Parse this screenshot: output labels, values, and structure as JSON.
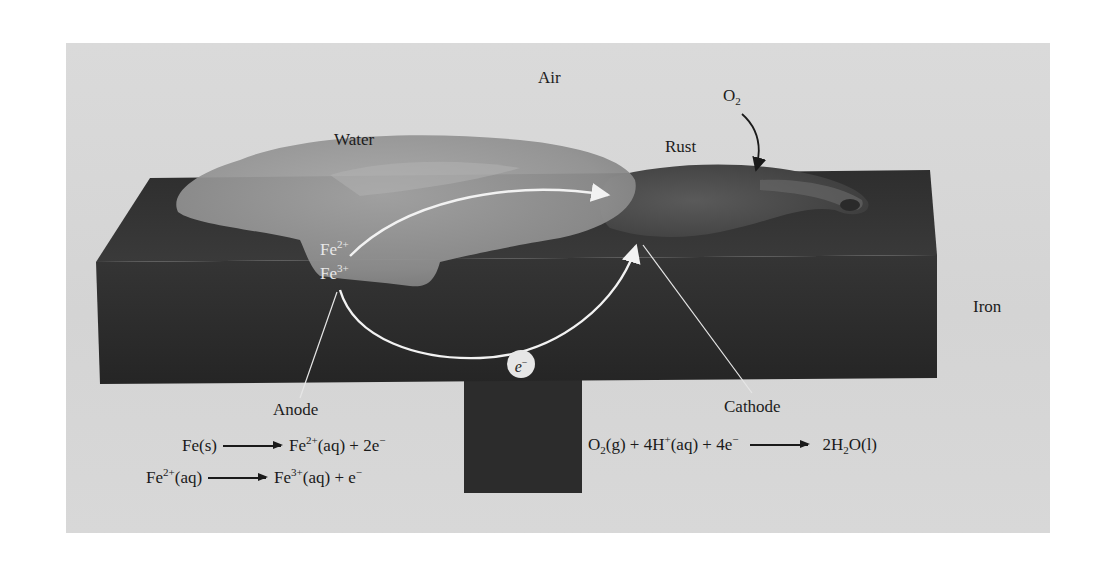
{
  "diagram": {
    "labels": {
      "air": "Air",
      "water": "Water",
      "rust": "Rust",
      "oxygen": {
        "base": "O",
        "sub": "2"
      },
      "iron": "Iron",
      "anode": "Anode",
      "cathode": "Cathode",
      "ion_fe2": {
        "base": "Fe",
        "sup": "2+"
      },
      "ion_fe3": {
        "base": "Fe",
        "sup": "3+"
      },
      "electron": {
        "base": "e",
        "sup": "−"
      }
    },
    "anode_reactions": [
      {
        "reactants": "Fe(s)",
        "products": {
          "p1_base": "Fe",
          "p1_sup": "2+",
          "p1_state": "(aq) + 2e",
          "p1_tail_sup": "−"
        }
      },
      {
        "reactants": {
          "base": "Fe",
          "sup": "2+",
          "state": "(aq)"
        },
        "products": {
          "p1_base": "Fe",
          "p1_sup": "3+",
          "p1_state": "(aq) + e",
          "p1_tail_sup": "−"
        }
      }
    ],
    "cathode_reaction": {
      "o2_base": "O",
      "o2_sub": "2",
      "o2_state": "(g) + 4H",
      "h_sup": "+",
      "h_state": "(aq) + 4e",
      "e_sup": "−",
      "product_pre": "2H",
      "product_sub": "2",
      "product_post": "O(l)"
    },
    "colors": {
      "background": "#d6d6d6",
      "iron_block": "#2b2b2b",
      "iron_top": "#3a3a3a",
      "water": "#8e8e8e",
      "rust": "#4a4a4a",
      "flow_arrow": "#f2f2f2"
    }
  }
}
